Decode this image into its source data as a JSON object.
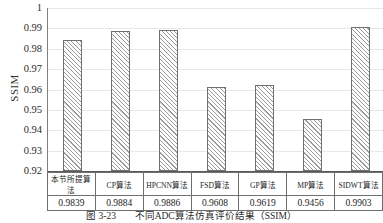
{
  "chart_data": {
    "type": "bar",
    "title": "",
    "xlabel": "",
    "ylabel": "SSIM",
    "ylim": [
      0.92,
      1.0
    ],
    "ytick_step": 0.01,
    "yticks": [
      "1",
      "0.99",
      "0.98",
      "0.97",
      "0.96",
      "0.95",
      "0.94",
      "0.93",
      "0.92"
    ],
    "grid": true,
    "legend": "none",
    "categories": [
      "本节所提算法",
      "CP算法",
      "HPCNN算法",
      "FSD算法",
      "GP算法",
      "MP算法",
      "SIDWT算法"
    ],
    "values": [
      0.9839,
      0.9884,
      0.9886,
      0.9608,
      0.9619,
      0.9456,
      0.9903
    ],
    "value_labels": [
      "0.9839",
      "0.9884",
      "0.9886",
      "0.9608",
      "0.9619",
      "0.9456",
      "0.9903"
    ],
    "bar_style": {
      "fill": "#fdfdfd",
      "hatch": "diagonal-45",
      "hatch_color": "#9a9a9a",
      "border_color": "#707070"
    }
  },
  "axis": {
    "y_title": "SSIM"
  },
  "data_table": {
    "name_row": [
      "本节所提算法",
      "CP算法",
      "HPCNN算法",
      "FSD算法",
      "GP算法",
      "MP算法",
      "SIDWT算法"
    ],
    "value_row": [
      "0.9839",
      "0.9884",
      "0.9886",
      "0.9608",
      "0.9619",
      "0.9456",
      "0.9903"
    ]
  },
  "caption": {
    "number": "图 3-23",
    "text": "不同ADC算法仿真评价结果（SSIM）"
  },
  "colors": {
    "grid": "#e8e8e8",
    "axis": "#707070",
    "text": "#1d1d1d"
  }
}
